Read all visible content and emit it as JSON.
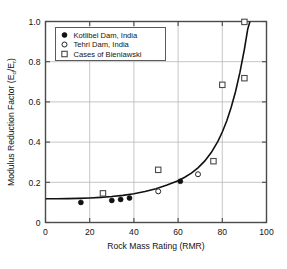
{
  "chart_data": {
    "type": "scatter",
    "title": "",
    "xlabel": "Rock Mass Rating (RMR)",
    "ylabel": "Modulus Reduction Factor (E",
    "ylabel_sub1": "d",
    "ylabel_mid": "/E",
    "ylabel_sub2": "r",
    "ylabel_end": ")",
    "ylabel_full": "Modulus Reduction Factor (Ed/Er)",
    "xlim": [
      0,
      100
    ],
    "ylim": [
      0,
      1.0
    ],
    "xticks": [
      0,
      20,
      40,
      60,
      80,
      100
    ],
    "xtick_labels": [
      "0",
      "20",
      "40",
      "60",
      "80",
      "100"
    ],
    "yticks": [
      0,
      0.2,
      0.4,
      0.6,
      0.8,
      1.0
    ],
    "ytick_labels": [
      "0",
      "0.2",
      "0.4",
      "0.6",
      "0.8",
      "1.0"
    ],
    "grid": true,
    "legend_position": "upper-left",
    "series": [
      {
        "name": "Kotlibel Dam, India",
        "marker": "filled-circle",
        "color": "#111111",
        "points": [
          [
            16,
            0.1
          ],
          [
            30,
            0.11
          ],
          [
            34,
            0.115
          ],
          [
            38,
            0.122
          ],
          [
            61,
            0.205
          ]
        ]
      },
      {
        "name": "Tehri Dam, India",
        "marker": "open-circle",
        "color": "#111111",
        "points": [
          [
            51,
            0.155
          ],
          [
            69,
            0.24
          ]
        ]
      },
      {
        "name": "Cases of Bieniawski",
        "marker": "open-square",
        "color": "#555555",
        "points": [
          [
            26,
            0.145
          ],
          [
            51,
            0.262
          ],
          [
            76,
            0.305
          ],
          [
            80,
            0.685
          ],
          [
            90,
            0.718
          ],
          [
            90,
            0.998
          ]
        ]
      }
    ],
    "fit_curve": {
      "name": "exponential fit",
      "color": "#111111",
      "points": [
        [
          0,
          0.118
        ],
        [
          5,
          0.118
        ],
        [
          10,
          0.119
        ],
        [
          15,
          0.12
        ],
        [
          20,
          0.122
        ],
        [
          25,
          0.125
        ],
        [
          30,
          0.129
        ],
        [
          35,
          0.135
        ],
        [
          40,
          0.143
        ],
        [
          45,
          0.154
        ],
        [
          50,
          0.168
        ],
        [
          55,
          0.186
        ],
        [
          60,
          0.208
        ],
        [
          63,
          0.225
        ],
        [
          66,
          0.246
        ],
        [
          69,
          0.272
        ],
        [
          72,
          0.305
        ],
        [
          75,
          0.348
        ],
        [
          78,
          0.404
        ],
        [
          80,
          0.45
        ],
        [
          82,
          0.505
        ],
        [
          84,
          0.572
        ],
        [
          86,
          0.652
        ],
        [
          88,
          0.748
        ],
        [
          90,
          0.862
        ],
        [
          91.5,
          0.962
        ],
        [
          92.5,
          1.0
        ]
      ]
    }
  },
  "legend": {
    "items": [
      {
        "label": "Kotlibel Dam, India",
        "marker": "filled-circle"
      },
      {
        "label": "Tehri Dam, India",
        "marker": "open-circle"
      },
      {
        "label": "Cases of Bieniawski",
        "marker": "open-square"
      }
    ]
  }
}
